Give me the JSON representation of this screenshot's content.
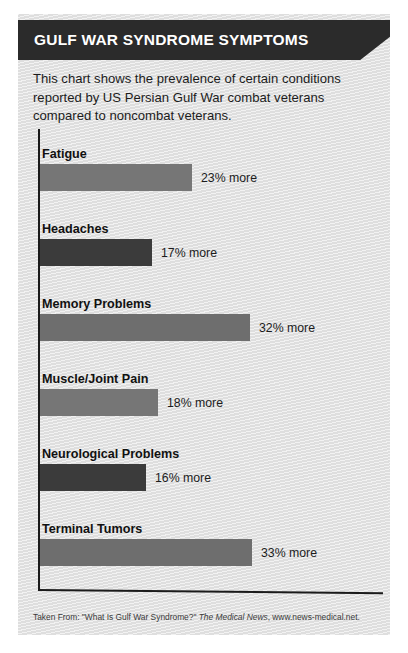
{
  "title": "GULF WAR SYNDROME SYMPTOMS",
  "intro": "This chart shows the prevalence of certain conditions reported by US Persian Gulf War combat veterans compared to noncombat veterans.",
  "footer": {
    "prefix": "Taken From: \"What Is Gulf War Syndrome?\" ",
    "source_italic": "The Medical News",
    "suffix": ", www.news-medical.net."
  },
  "colors": {
    "card_background": "#e3e3e3",
    "banner": "#2b2b2b",
    "bar_light": "#767676",
    "bar_dark": "#3b3b3b",
    "axis": "#1a1a1a",
    "text": "#1c1c1c"
  },
  "chart_data": {
    "type": "bar",
    "orientation": "horizontal",
    "title": "GULF WAR SYNDROME SYMPTOMS",
    "xlabel": "",
    "ylabel": "",
    "xlim": [
      0,
      40
    ],
    "grid": false,
    "legend": null,
    "value_suffix": "% more",
    "categories": [
      "Fatigue",
      "Headaches",
      "Memory Problems",
      "Muscle/Joint Pain",
      "Neurological Problems",
      "Terminal Tumors"
    ],
    "values": [
      23,
      17,
      32,
      18,
      16,
      33
    ],
    "labels": [
      "23% more",
      "17% more",
      "32% more",
      "18% more",
      "16% more",
      "33% more"
    ],
    "bar_colors": [
      "#767676",
      "#3b3b3b",
      "#6e6e6e",
      "#767676",
      "#3b3b3b",
      "#6e6e6e"
    ],
    "bar_pixel_widths": [
      152,
      112,
      210,
      118,
      106,
      212
    ],
    "bar_top_offsets": [
      20,
      95,
      170,
      245,
      320,
      395
    ]
  }
}
